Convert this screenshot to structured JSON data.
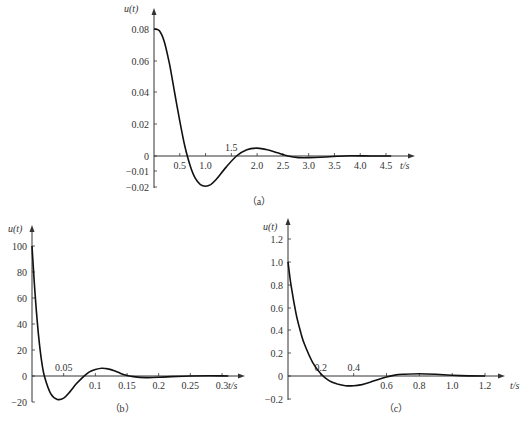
{
  "chart_data": [
    {
      "id": "a",
      "type": "line",
      "caption": "（a）",
      "ylabel": "u(t)",
      "xlabel": "t/s",
      "xticks": [
        "0.5",
        "1.0",
        "1.5",
        "2.0",
        "2.5",
        "3.0",
        "3.5",
        "4.0",
        "4.5"
      ],
      "yticks": [
        "0.08",
        "0.06",
        "0.04",
        "0.02",
        "0",
        "−0.01",
        "−0.02"
      ],
      "xlim": [
        0,
        4.5
      ],
      "ylim": [
        -0.02,
        0.08
      ],
      "x": [
        0,
        0.1,
        0.2,
        0.3,
        0.4,
        0.5,
        0.6,
        0.7,
        0.8,
        0.9,
        1.0,
        1.1,
        1.2,
        1.4,
        1.6,
        1.8,
        2.0,
        2.2,
        2.4,
        2.6,
        2.8,
        3.0,
        3.4,
        3.8,
        4.2,
        4.6
      ],
      "values": [
        0.08,
        0.079,
        0.072,
        0.058,
        0.04,
        0.022,
        0.006,
        -0.006,
        -0.014,
        -0.018,
        -0.019,
        -0.018,
        -0.015,
        -0.007,
        0.0,
        0.004,
        0.005,
        0.004,
        0.002,
        0.0,
        -0.001,
        -0.001,
        -0.0005,
        0.0002,
        0.0,
        0.0
      ]
    },
    {
      "id": "b",
      "type": "line",
      "caption": "（b）",
      "ylabel": "u(t)",
      "xlabel": "t/s",
      "xticks": [
        "0.05",
        "0.1",
        "0.15",
        "0.2",
        "0.25",
        "0.3"
      ],
      "yticks": [
        "100",
        "80",
        "60",
        "40",
        "20",
        "0",
        "−20"
      ],
      "xlim": [
        0,
        0.3
      ],
      "ylim": [
        -20,
        100
      ],
      "x": [
        0,
        0.005,
        0.01,
        0.015,
        0.02,
        0.03,
        0.04,
        0.05,
        0.06,
        0.07,
        0.08,
        0.09,
        0.1,
        0.11,
        0.12,
        0.13,
        0.14,
        0.15,
        0.16,
        0.18,
        0.2,
        0.22,
        0.25,
        0.28,
        0.31
      ],
      "values": [
        100,
        62,
        33,
        12,
        -1,
        -14,
        -18,
        -17,
        -12,
        -6,
        -1,
        3,
        5,
        6,
        5.5,
        4,
        2,
        0.5,
        -0.5,
        -1.2,
        -1,
        -0.5,
        0,
        0.2,
        0
      ]
    },
    {
      "id": "c",
      "type": "line",
      "caption": "（c）",
      "ylabel": "u(t)",
      "xlabel": "t/s",
      "xticks": [
        "0.2",
        "0.4",
        "0.6",
        "0.8",
        "1.0",
        "1.2"
      ],
      "yticks": [
        "1.2",
        "1.0",
        "0.8",
        "0.6",
        "0.4",
        "0.2",
        "0",
        "−0.2"
      ],
      "xlim": [
        0,
        1.2
      ],
      "ylim": [
        -0.2,
        1.2
      ],
      "x": [
        0,
        0.02,
        0.05,
        0.08,
        0.1,
        0.15,
        0.2,
        0.25,
        0.3,
        0.35,
        0.4,
        0.45,
        0.5,
        0.55,
        0.6,
        0.65,
        0.7,
        0.8,
        0.9,
        1.0,
        1.1,
        1.2
      ],
      "values": [
        1.0,
        0.78,
        0.54,
        0.37,
        0.28,
        0.12,
        0.02,
        -0.04,
        -0.07,
        -0.085,
        -0.085,
        -0.075,
        -0.055,
        -0.03,
        -0.008,
        0.008,
        0.015,
        0.02,
        0.015,
        0.006,
        0.001,
        0.0
      ]
    }
  ]
}
